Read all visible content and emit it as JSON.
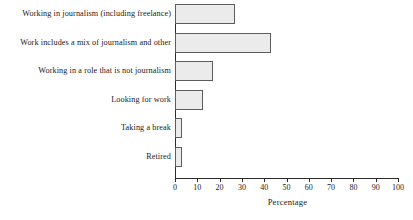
{
  "chart_data": {
    "type": "bar",
    "orientation": "horizontal",
    "title": "",
    "xlabel": "Percentage",
    "ylabel": "",
    "xlim": [
      0,
      100
    ],
    "grid": false,
    "legend": false,
    "categories": [
      "Working in journalism (including freelance)",
      "Work includes a mix of journalism and other",
      "Working in a role that is not journalism",
      "Looking for work",
      "Taking a break",
      "Retired"
    ],
    "values": [
      27,
      43,
      17,
      12.5,
      3,
      3
    ],
    "xticks": [
      0,
      10,
      20,
      30,
      40,
      50,
      60,
      70,
      80,
      90,
      100
    ],
    "xtick_labels": [
      "0",
      "10",
      "20",
      "30",
      "40",
      "50",
      "60",
      "70",
      "80",
      "90",
      "100"
    ],
    "colors": {
      "bar_fill": "#ebebeb",
      "bar_border": "#5d5d5d",
      "axis": "#2b2b2b",
      "text": "#1a1a1a",
      "background": "#ffffff"
    }
  }
}
